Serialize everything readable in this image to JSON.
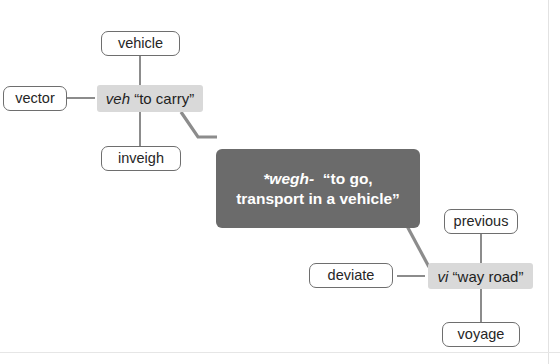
{
  "diagram": {
    "colors": {
      "background": "#ffffff",
      "pill_border": "#6e6e6e",
      "pill_text": "#262626",
      "shaded_fill": "#d9d9d9",
      "dark_fill": "#6b6b6b",
      "dark_text": "#ffffff",
      "connector": "#8c8c8c"
    },
    "root_node": {
      "name": "wegh-root",
      "root": "*wegh-",
      "gloss_line1": "“to go,",
      "gloss_line2": "transport in a vehicle”"
    },
    "branches": [
      {
        "name": "veh-branch",
        "root": "veh",
        "gloss": "“to carry”",
        "derivatives": [
          {
            "label": "vehicle"
          },
          {
            "label": "vector"
          },
          {
            "label": "inveigh"
          }
        ]
      },
      {
        "name": "vi-branch",
        "root": "vi",
        "gloss": "“way road”",
        "derivatives": [
          {
            "label": "previous"
          },
          {
            "label": "deviate"
          },
          {
            "label": "voyage"
          }
        ]
      }
    ]
  }
}
